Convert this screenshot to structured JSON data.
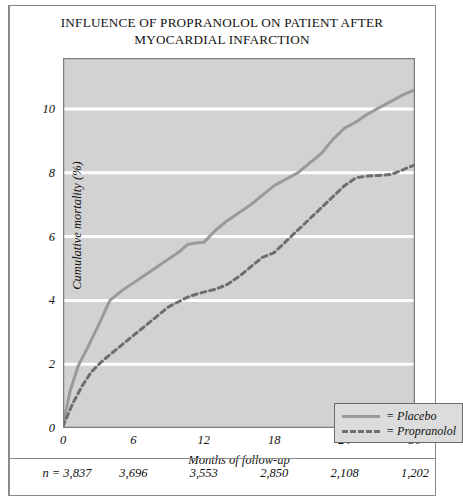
{
  "chart_data": {
    "type": "line",
    "title": "INFLUENCE OF PROPRANOLOL ON PATIENT AFTER MYOCARDIAL INFARCTION",
    "title_lines": [
      "INFLUENCE OF PROPRANOLOL ON PATIENT AFTER",
      "MYOCARDIAL INFARCTION"
    ],
    "xlabel": "Months of follow-up",
    "ylabel": "Cumulative mortality (%)",
    "xlim": [
      0,
      30
    ],
    "ylim": [
      0,
      11.6
    ],
    "xticks": [
      0,
      6,
      12,
      18,
      24,
      30
    ],
    "xtick_labels": [
      "0",
      "6",
      "12",
      "18",
      "24",
      "30"
    ],
    "yticks": [
      0,
      2,
      4,
      6,
      8,
      10
    ],
    "ytick_labels": [
      "0",
      "2",
      "4",
      "6",
      "8",
      "10"
    ],
    "grid": "horizontal-white-lines",
    "plot_background": "#d2d2d2",
    "legend_position": "lower-right-inside",
    "series": [
      {
        "name": "Placebo",
        "legend_label": "= Placebo",
        "style": "solid",
        "color": "#9a9a9a",
        "x": [
          0,
          0.6,
          1.3,
          2.0,
          3.0,
          4.0,
          5.0,
          6.0,
          7.0,
          8.0,
          9.0,
          10.0,
          10.6,
          11.3,
          12.0,
          13.0,
          14.0,
          15.0,
          16.0,
          17.0,
          18.0,
          19.0,
          20.0,
          21.0,
          22.0,
          23.0,
          24.0,
          25.0,
          26.0,
          27.0,
          28.0,
          29.0,
          30.0
        ],
        "y": [
          0.1,
          1.15,
          1.95,
          2.45,
          3.2,
          4.0,
          4.3,
          4.55,
          4.8,
          5.05,
          5.3,
          5.55,
          5.75,
          5.8,
          5.82,
          6.2,
          6.5,
          6.75,
          7.0,
          7.3,
          7.6,
          7.8,
          8.0,
          8.3,
          8.6,
          9.05,
          9.4,
          9.6,
          9.85,
          10.05,
          10.25,
          10.45,
          10.6
        ]
      },
      {
        "name": "Propranolol",
        "legend_label": "= Propranolol",
        "style": "dashed",
        "color": "#6e6e6e",
        "x": [
          0,
          0.8,
          1.6,
          2.4,
          3.2,
          4.0,
          5.0,
          6.0,
          7.0,
          8.0,
          9.0,
          9.8,
          10.6,
          11.4,
          12.2,
          13.0,
          14.0,
          15.0,
          16.0,
          17.0,
          18.0,
          19.0,
          20.0,
          21.0,
          22.0,
          23.0,
          24.0,
          25.0,
          26.0,
          27.0,
          28.0,
          29.0,
          30.0
        ],
        "y": [
          0.05,
          0.75,
          1.3,
          1.75,
          2.05,
          2.3,
          2.6,
          2.9,
          3.2,
          3.5,
          3.8,
          3.95,
          4.1,
          4.2,
          4.28,
          4.35,
          4.5,
          4.75,
          5.05,
          5.35,
          5.5,
          5.85,
          6.2,
          6.55,
          6.9,
          7.25,
          7.6,
          7.85,
          7.9,
          7.92,
          7.95,
          8.1,
          8.25
        ]
      }
    ],
    "footer_row": {
      "prefix": "n = ",
      "values": [
        "3,837",
        "3,696",
        "3,553",
        "2,850",
        "2,108",
        "1,202"
      ],
      "at_x": [
        0,
        6,
        12,
        18,
        24,
        30
      ]
    }
  }
}
